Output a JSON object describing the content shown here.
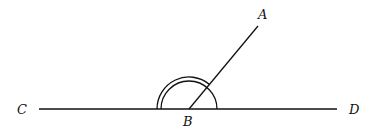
{
  "diagram": {
    "type": "angle-diagram",
    "labels": {
      "A": "A",
      "B": "B",
      "C": "C",
      "D": "D"
    },
    "points": {
      "A": [
        258,
        26
      ],
      "B": [
        189,
        109
      ],
      "C": [
        39,
        109
      ],
      "D": [
        337,
        109
      ]
    },
    "segments": [
      {
        "from": "C",
        "to": "D"
      },
      {
        "from": "B",
        "to": "A"
      }
    ],
    "angle_marks": [
      {
        "angle": "CBA",
        "arcs": 2
      },
      {
        "angle": "ABD",
        "arcs": 1
      }
    ],
    "colors": {
      "stroke": "#111111",
      "background": "#ffffff"
    }
  }
}
